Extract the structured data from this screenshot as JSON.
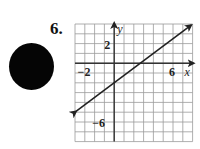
{
  "problem": {
    "number_label": "6."
  },
  "bullet": {
    "shape": "filled-circle",
    "color": "#050505"
  },
  "chart_data": {
    "type": "line",
    "title": "",
    "xlabel": "x",
    "ylabel": "y",
    "xlim": [
      -4,
      8
    ],
    "ylim": [
      -8,
      4
    ],
    "grid": true,
    "grid_step": 1,
    "tick_labels": {
      "x": [
        {
          "value": -2,
          "label": "−2"
        },
        {
          "value": 6,
          "label": "6"
        }
      ],
      "y": [
        {
          "value": 2,
          "label": "2"
        },
        {
          "value": -6,
          "label": "−6"
        }
      ]
    },
    "series": [
      {
        "name": "line",
        "equation": "y = 3/4 x - 2",
        "slope": 0.75,
        "intercept": -2,
        "x": [
          -4,
          0,
          8
        ],
        "y": [
          -5,
          -2,
          4
        ],
        "arrows": "both",
        "color": "#222222"
      }
    ],
    "legend": null
  },
  "labels": {
    "x_axis": "x",
    "y_axis": "y",
    "x_tick_neg2": "−2",
    "x_tick_6": "6",
    "y_tick_2": "2",
    "y_tick_neg6": "−6"
  }
}
